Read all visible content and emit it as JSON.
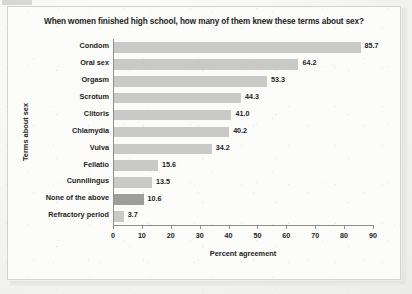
{
  "chart_data": {
    "type": "bar",
    "orientation": "horizontal",
    "title": "When women finished high school, how many of them knew these terms about sex?",
    "xlabel": "Percent agreement",
    "ylabel": "Terms about sex",
    "xlim": [
      0,
      90
    ],
    "xticks": [
      0,
      10,
      20,
      30,
      40,
      50,
      60,
      70,
      80,
      90
    ],
    "grid": false,
    "legend": null,
    "bar_color": "#c9c9c7",
    "highlight_color": "#9d9d9b",
    "categories": [
      "Condom",
      "Oral sex",
      "Orgasm",
      "Scrotum",
      "Clitoris",
      "Chlamydia",
      "Vulva",
      "Fellatio",
      "Cunnilingus",
      "None of the above",
      "Refractory period"
    ],
    "values": [
      85.7,
      64.2,
      53.3,
      44.3,
      41.0,
      40.2,
      34.2,
      15.6,
      13.5,
      10.6,
      3.7
    ],
    "value_labels": [
      "85.7",
      "64.2",
      "53.3",
      "44.3",
      "41.0",
      "40.2",
      "34.2",
      "15.6",
      "13.5",
      "10.6",
      "3.7"
    ],
    "highlighted": [
      "None of the above"
    ]
  }
}
